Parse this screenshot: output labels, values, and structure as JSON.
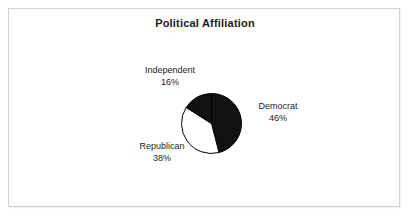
{
  "chart": {
    "title": "Political Affiliation"
  },
  "chart_data": {
    "type": "pie",
    "title": "Political Affiliation",
    "xlabel": "",
    "ylabel": "",
    "legend": "none",
    "grid": false,
    "start_angle_deg": 0,
    "direction": "clockwise",
    "categories": [
      "Democrat",
      "Republican",
      "Independent"
    ],
    "values": [
      46,
      38,
      16
    ],
    "unit": "%",
    "colors": [
      "#111111",
      "#ffffff",
      "#111111"
    ],
    "outline_color": "#000000",
    "labels": [
      {
        "name": "Democrat",
        "percent": "46%",
        "value": 46,
        "color": "#111111"
      },
      {
        "name": "Republican",
        "percent": "38%",
        "value": 38,
        "color": "#ffffff"
      },
      {
        "name": "Independent",
        "percent": "16%",
        "value": 16,
        "color": "#111111"
      }
    ]
  },
  "frame": {
    "border_color": "#d2d2d2",
    "background": "#ffffff"
  }
}
